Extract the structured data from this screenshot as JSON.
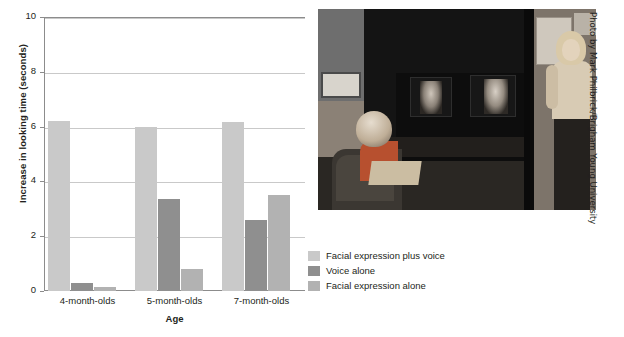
{
  "chart_data": {
    "type": "bar",
    "title": "",
    "xlabel": "Age",
    "ylabel": "Increase in looking time (seconds)",
    "categories": [
      "4-month-olds",
      "5-month-olds",
      "7-month-olds"
    ],
    "series": [
      {
        "name": "Facial expression plus voice",
        "color": "#c9c9c9",
        "values": [
          6.2,
          6.0,
          6.15
        ]
      },
      {
        "name": "Voice alone",
        "color": "#8f8f8f",
        "values": [
          0.3,
          3.35,
          2.6
        ]
      },
      {
        "name": "Facial expression alone",
        "color": "#b2b2b2",
        "values": [
          0.15,
          0.8,
          3.5
        ]
      }
    ],
    "ylim": [
      0,
      10
    ],
    "yticks": [
      0,
      2,
      4,
      6,
      8,
      10
    ],
    "ytick_labels": [
      "0",
      "2",
      "4",
      "6",
      "8",
      "10"
    ],
    "grid": "horizontal",
    "legend_position": "right-bottom"
  },
  "legend": {
    "items": [
      {
        "label": "Facial expression plus voice",
        "swatch": "legend-swatch-series-0"
      },
      {
        "label": "Voice alone",
        "swatch": "legend-swatch-series-1"
      },
      {
        "label": "Facial expression alone",
        "swatch": "legend-swatch-series-2"
      }
    ]
  },
  "photo": {
    "credit": "Photo by Mark Philbrick/Brigham Young University",
    "description": "infant-in-highchair-viewing-two-face-monitors-with-researcher"
  }
}
